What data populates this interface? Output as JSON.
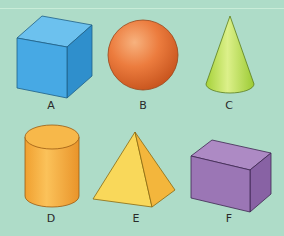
{
  "background_color": "#aedcc8",
  "shapes": [
    {
      "label": "A",
      "name": "cube",
      "color": "#3fa6e0"
    },
    {
      "label": "B",
      "name": "sphere",
      "color": "#e8763a"
    },
    {
      "label": "C",
      "name": "cone",
      "color": "#b6dc4a"
    },
    {
      "label": "D",
      "name": "cylinder",
      "color": "#f5a93a"
    },
    {
      "label": "E",
      "name": "square-pyramid",
      "color": "#f8d556"
    },
    {
      "label": "F",
      "name": "cuboid",
      "color": "#a07ab8"
    }
  ]
}
